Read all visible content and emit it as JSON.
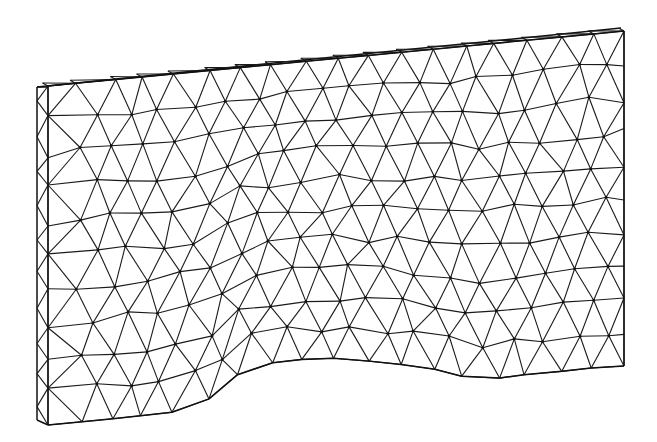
{
  "figure": {
    "type": "finite-element-mesh",
    "colors": {
      "line": "#1a1a1a",
      "background": "#ffffff"
    },
    "slab": {
      "thickness_offset": [
        11,
        0
      ],
      "top_left": [
        37,
        87
      ],
      "top_right": [
        624,
        31
      ],
      "right_bottom": [
        624,
        366
      ],
      "left_bottom": [
        37,
        420
      ]
    },
    "bottom_profile": [
      [
        37,
        420
      ],
      [
        48,
        425
      ],
      [
        120,
        418
      ],
      [
        192,
        410
      ],
      [
        215,
        395
      ],
      [
        232,
        378
      ],
      [
        252,
        366
      ],
      [
        290,
        360
      ],
      [
        330,
        358
      ],
      [
        380,
        362
      ],
      [
        430,
        368
      ],
      [
        480,
        381
      ],
      [
        520,
        375
      ],
      [
        556,
        372
      ],
      [
        600,
        367
      ],
      [
        624,
        366
      ]
    ],
    "mesh": {
      "cols": 18,
      "rows": 10,
      "jitter": 0.28,
      "seed": 7
    }
  }
}
